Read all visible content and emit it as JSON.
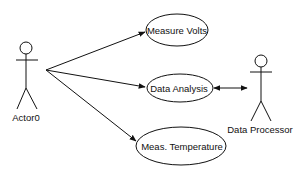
{
  "diagram": {
    "type": "use-case",
    "actors": [
      {
        "id": "actor0",
        "label": "Actor0"
      },
      {
        "id": "actor1",
        "label": "Data Processor"
      }
    ],
    "use_cases": [
      {
        "id": "uc0",
        "label": "Measure Volts"
      },
      {
        "id": "uc1",
        "label": "Data Analysis"
      },
      {
        "id": "uc2",
        "label": "Meas. Temperature"
      }
    ],
    "edges": [
      {
        "from": "Actor0",
        "to": "Measure Volts",
        "arrow": "end"
      },
      {
        "from": "Actor0",
        "to": "Data Analysis",
        "arrow": "end"
      },
      {
        "from": "Actor0",
        "to": "Meas. Temperature",
        "arrow": "end"
      },
      {
        "from": "Data Analysis",
        "to": "Data Processor",
        "arrow": "both"
      }
    ],
    "colors": {
      "stroke": "#111111",
      "background": "#ffffff"
    }
  }
}
